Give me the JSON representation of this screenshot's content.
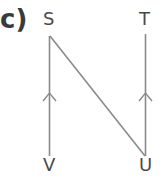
{
  "part_label": "c)",
  "vertices": {
    "S": "S",
    "T": "T",
    "U": "U",
    "V": "V"
  },
  "edges": [
    {
      "from": "V",
      "to": "S",
      "arrow": "up"
    },
    {
      "from": "S",
      "to": "U",
      "arrow": "none"
    },
    {
      "from": "U",
      "to": "T",
      "arrow": "up"
    }
  ],
  "colors": {
    "line": "#8a8a8a",
    "text": "#4a4a4a"
  }
}
